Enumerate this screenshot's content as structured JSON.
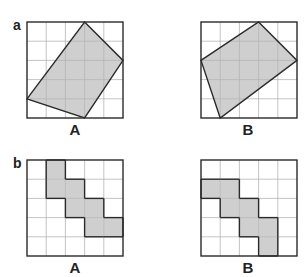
{
  "panels": [
    {
      "label": "a",
      "figures": [
        {
          "label": "A",
          "grid": 5,
          "type": "polygon",
          "points": [
            [
              3,
              0
            ],
            [
              5,
              2
            ],
            [
              3,
              5
            ],
            [
              0,
              4
            ]
          ]
        },
        {
          "label": "B",
          "grid": 5,
          "type": "polygon",
          "points": [
            [
              3,
              0
            ],
            [
              5,
              2
            ],
            [
              1,
              5
            ],
            [
              0,
              2
            ]
          ]
        }
      ]
    },
    {
      "label": "b",
      "figures": [
        {
          "label": "A",
          "grid": 5,
          "type": "cells",
          "cells": [
            [
              1,
              0
            ],
            [
              1,
              1
            ],
            [
              2,
              1
            ],
            [
              2,
              2
            ],
            [
              3,
              2
            ],
            [
              3,
              3
            ],
            [
              4,
              3
            ]
          ]
        },
        {
          "label": "B",
          "grid": 5,
          "type": "cells",
          "cells": [
            [
              0,
              1
            ],
            [
              1,
              1
            ],
            [
              1,
              2
            ],
            [
              2,
              2
            ],
            [
              2,
              3
            ],
            [
              3,
              3
            ],
            [
              3,
              4
            ]
          ]
        }
      ]
    }
  ],
  "colors": {
    "shade": "#cfcfcf",
    "grid": "#b5b5b5",
    "outline": "#2a2a2a"
  }
}
